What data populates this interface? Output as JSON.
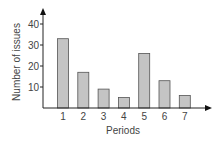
{
  "chart_data": {
    "type": "bar",
    "title": "",
    "xlabel": "Periods",
    "ylabel": "Number of issues",
    "categories": [
      "1",
      "2",
      "3",
      "4",
      "5",
      "6",
      "7"
    ],
    "values": [
      33,
      17,
      9,
      5,
      26,
      13,
      6
    ],
    "yticks": [
      "10",
      "20",
      "30",
      "40"
    ],
    "ylim": [
      0,
      45
    ],
    "grid": false,
    "legend": null,
    "bar_color": "#c4c4c4",
    "bar_edge": "#555555"
  }
}
